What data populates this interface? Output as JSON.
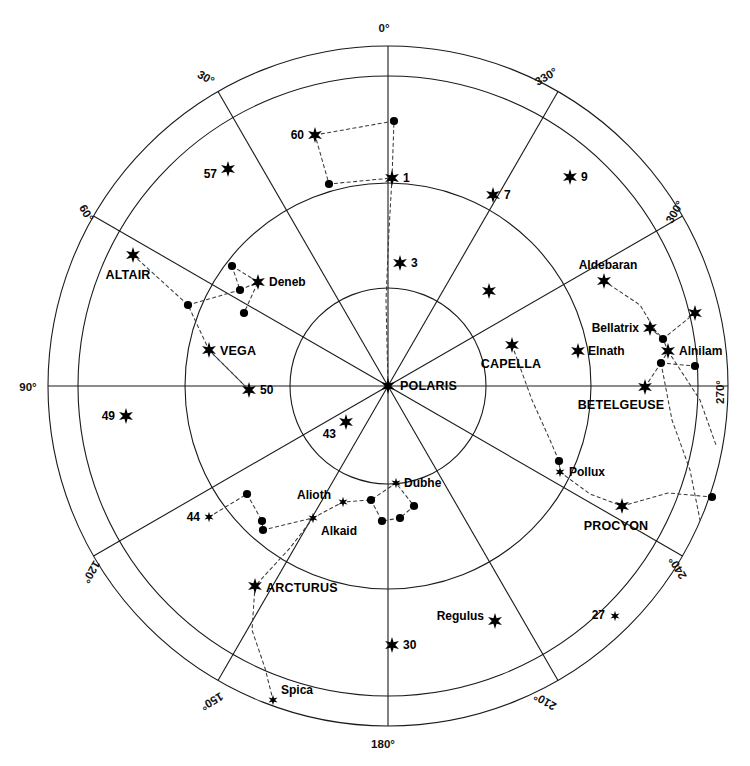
{
  "chart_data": {
    "type": "scatter",
    "title": "",
    "projection": "polar-azimuthal",
    "center": {
      "x": 388,
      "y": 386,
      "label": "POLARIS"
    },
    "radial_axis": {
      "description": "Altitude rings (concentric circles)",
      "ring_radii_px": [
        98,
        203,
        310,
        340
      ],
      "grid": true
    },
    "angular_axis": {
      "label_suffix": "°",
      "tick_step": 30,
      "direction": "clockwise-from-top-is-decreasing",
      "ticks": [
        {
          "value": 0,
          "text": "0°"
        },
        {
          "value": 330,
          "text": "330°"
        },
        {
          "value": 300,
          "text": "300°"
        },
        {
          "value": 270,
          "text": "270°"
        },
        {
          "value": 240,
          "text": "240°"
        },
        {
          "value": 210,
          "text": "210°"
        },
        {
          "value": 180,
          "text": "180°"
        },
        {
          "value": 150,
          "text": "150°"
        },
        {
          "value": 120,
          "text": "120°"
        },
        {
          "value": 90,
          "text": "90°"
        },
        {
          "value": 60,
          "text": "60°"
        },
        {
          "value": 30,
          "text": "30°"
        }
      ]
    },
    "legend": {
      "position": "none",
      "entries": []
    },
    "stars": [
      {
        "name": "POLARIS",
        "label": "POLARIS",
        "x": 388,
        "y": 386,
        "mag": "bright",
        "marker": "star",
        "label_dx": 12,
        "label_dy": 4,
        "anchor": "start",
        "style": "caps"
      },
      {
        "name": "star-60",
        "label": "60",
        "x": 315,
        "y": 135,
        "mag": "bright",
        "marker": "star",
        "label_dx": -11,
        "label_dy": 4,
        "anchor": "end",
        "style": "small"
      },
      {
        "name": "star-1",
        "label": "1",
        "x": 392,
        "y": 178,
        "mag": "bright",
        "marker": "star",
        "label_dx": 11,
        "label_dy": 4,
        "anchor": "start",
        "style": "small"
      },
      {
        "name": "star-57",
        "label": "57",
        "x": 228,
        "y": 169,
        "mag": "bright",
        "marker": "star",
        "label_dx": -11,
        "label_dy": 9,
        "anchor": "end",
        "style": "small"
      },
      {
        "name": "star-7",
        "label": "7",
        "x": 493,
        "y": 195,
        "mag": "bright",
        "marker": "star",
        "label_dx": 11,
        "label_dy": 4,
        "anchor": "start",
        "style": "small"
      },
      {
        "name": "star-9",
        "label": "9",
        "x": 570,
        "y": 177,
        "mag": "bright",
        "marker": "star",
        "label_dx": 11,
        "label_dy": 4,
        "anchor": "start",
        "style": "small"
      },
      {
        "name": "star-3",
        "label": "3",
        "x": 400,
        "y": 263,
        "mag": "bright",
        "marker": "star",
        "label_dx": 11,
        "label_dy": 4,
        "anchor": "start",
        "style": "small"
      },
      {
        "name": "ALTAIR",
        "label": "ALTAIR",
        "x": 133,
        "y": 255,
        "mag": "bright",
        "marker": "star",
        "label_dx": -5,
        "label_dy": 24,
        "anchor": "middle",
        "style": "caps"
      },
      {
        "name": "Deneb",
        "label": "Deneb",
        "x": 258,
        "y": 282,
        "mag": "bright",
        "marker": "star",
        "label_dx": 11,
        "label_dy": 4,
        "anchor": "start",
        "style": "small"
      },
      {
        "name": "VEGA",
        "label": "VEGA",
        "x": 209,
        "y": 350,
        "mag": "bright",
        "marker": "star",
        "label_dx": 11,
        "label_dy": 5,
        "anchor": "start",
        "style": "caps"
      },
      {
        "name": "star-50",
        "label": "50",
        "x": 249,
        "y": 390,
        "mag": "bright",
        "marker": "star",
        "label_dx": 11,
        "label_dy": 4,
        "anchor": "start",
        "style": "small"
      },
      {
        "name": "star-49",
        "label": "49",
        "x": 126,
        "y": 416,
        "mag": "bright",
        "marker": "star",
        "label_dx": -11,
        "label_dy": 4,
        "anchor": "end",
        "style": "small"
      },
      {
        "name": "star-43",
        "label": "43",
        "x": 346,
        "y": 422,
        "mag": "bright",
        "marker": "star",
        "label_dx": -10,
        "label_dy": 16,
        "anchor": "end",
        "style": "small"
      },
      {
        "name": "star-44",
        "label": "44",
        "x": 209,
        "y": 517,
        "mag": "faint",
        "marker": "star",
        "label_dx": -9,
        "label_dy": 4,
        "anchor": "end",
        "style": "small"
      },
      {
        "name": "Alkaid",
        "label": "Alkaid",
        "x": 313,
        "y": 518,
        "mag": "faint",
        "marker": "star",
        "label_dx": 8,
        "label_dy": 17,
        "anchor": "start",
        "style": "small"
      },
      {
        "name": "Alioth",
        "label": "Alioth",
        "x": 343,
        "y": 502,
        "mag": "faint",
        "marker": "star",
        "label_dx": -12,
        "label_dy": -3,
        "anchor": "end",
        "style": "small"
      },
      {
        "name": "Dubhe",
        "label": "Dubhe",
        "x": 396,
        "y": 483,
        "mag": "faint",
        "marker": "star",
        "label_dx": 8,
        "label_dy": 4,
        "anchor": "start",
        "style": "small"
      },
      {
        "name": "ARCTURUS",
        "label": "ARCTURUS",
        "x": 255,
        "y": 586,
        "mag": "bright",
        "marker": "star",
        "label_dx": 11,
        "label_dy": 6,
        "anchor": "start",
        "style": "caps"
      },
      {
        "name": "Spica",
        "label": "Spica",
        "x": 273,
        "y": 700,
        "mag": "faint",
        "marker": "star",
        "label_dx": 8,
        "label_dy": -6,
        "anchor": "start",
        "style": "small"
      },
      {
        "name": "star-30",
        "label": "30",
        "x": 392,
        "y": 645,
        "mag": "bright",
        "marker": "star",
        "label_dx": 11,
        "label_dy": 4,
        "anchor": "start",
        "style": "small"
      },
      {
        "name": "Regulus",
        "label": "Regulus",
        "x": 495,
        "y": 621,
        "mag": "bright",
        "marker": "star",
        "label_dx": -11,
        "label_dy": -1,
        "anchor": "end",
        "style": "small"
      },
      {
        "name": "star-27",
        "label": "27",
        "x": 615,
        "y": 616,
        "mag": "faint",
        "marker": "star",
        "label_dx": -10,
        "label_dy": 3,
        "anchor": "end",
        "style": "small"
      },
      {
        "name": "PROCYON",
        "label": "PROCYON",
        "x": 622,
        "y": 506,
        "mag": "bright",
        "marker": "star",
        "label_dx": -6,
        "label_dy": 24,
        "anchor": "middle",
        "style": "caps"
      },
      {
        "name": "Pollux",
        "label": "Pollux",
        "x": 560,
        "y": 472,
        "mag": "faint",
        "marker": "star",
        "label_dx": 9,
        "label_dy": 4,
        "anchor": "start",
        "style": "small"
      },
      {
        "name": "CAPELLA",
        "label": "CAPELLA",
        "x": 512,
        "y": 345,
        "mag": "bright",
        "marker": "star",
        "label_dx": -1,
        "label_dy": 23,
        "anchor": "middle",
        "style": "caps"
      },
      {
        "name": "BETELGEUSE",
        "label": "BETELGEUSE",
        "x": 645,
        "y": 387,
        "mag": "bright",
        "marker": "star",
        "label_dx": -24,
        "label_dy": 22,
        "anchor": "middle",
        "style": "caps"
      },
      {
        "name": "Elnath",
        "label": "Elnath",
        "x": 578,
        "y": 351,
        "mag": "bright",
        "marker": "star",
        "label_dx": 10,
        "label_dy": 4,
        "anchor": "start",
        "style": "small"
      },
      {
        "name": "Bellatrix",
        "label": "Bellatrix",
        "x": 650,
        "y": 328,
        "mag": "bright",
        "marker": "star",
        "label_dx": -11,
        "label_dy": 4,
        "anchor": "end",
        "style": "small"
      },
      {
        "name": "Aldebaran",
        "label": "Aldebaran",
        "x": 604,
        "y": 281,
        "mag": "bright",
        "marker": "star",
        "label_dx": 4,
        "label_dy": -12,
        "anchor": "middle",
        "style": "small"
      },
      {
        "name": "Alnilam",
        "label": "Alnilam",
        "x": 668,
        "y": 351,
        "mag": "bright",
        "marker": "star",
        "label_dx": 11,
        "label_dy": 4,
        "anchor": "start",
        "style": "small"
      },
      {
        "name": "orion-rigel",
        "label": "",
        "x": 695,
        "y": 313,
        "mag": "bright",
        "marker": "star",
        "label_dx": 0,
        "label_dy": 0,
        "anchor": "start",
        "style": "small"
      },
      {
        "name": "star-unlabeled-upper",
        "label": "",
        "x": 489,
        "y": 291,
        "mag": "bright",
        "marker": "star",
        "label_dx": 0,
        "label_dy": 0,
        "anchor": "start",
        "style": "small"
      }
    ],
    "dots": [
      {
        "name": "dot-ursa-minor-top",
        "x": 394,
        "y": 121
      },
      {
        "name": "dot-ursa-minor-left",
        "x": 329,
        "y": 184
      },
      {
        "name": "dot-cygnus-a",
        "x": 232,
        "y": 266
      },
      {
        "name": "dot-cygnus-b",
        "x": 240,
        "y": 290
      },
      {
        "name": "dot-cygnus-c",
        "x": 244,
        "y": 313
      },
      {
        "name": "dot-lyra-w",
        "x": 188,
        "y": 305
      },
      {
        "name": "dot-big-dipper-a",
        "x": 247,
        "y": 494
      },
      {
        "name": "dot-big-dipper-b",
        "x": 262,
        "y": 521
      },
      {
        "name": "dot-big-dipper-c",
        "x": 263,
        "y": 530
      },
      {
        "name": "dot-big-dipper-d",
        "x": 371,
        "y": 500
      },
      {
        "name": "dot-big-dipper-e",
        "x": 382,
        "y": 521
      },
      {
        "name": "dot-big-dipper-f",
        "x": 400,
        "y": 518
      },
      {
        "name": "dot-big-dipper-g",
        "x": 414,
        "y": 506
      },
      {
        "name": "dot-gemini-castor",
        "x": 559,
        "y": 461
      },
      {
        "name": "dot-orion-belt-top",
        "x": 663,
        "y": 339
      },
      {
        "name": "dot-orion-belt-mid",
        "x": 661,
        "y": 363
      },
      {
        "name": "dot-orion-right",
        "x": 695,
        "y": 366
      },
      {
        "name": "dot-canis-minor-e",
        "x": 712,
        "y": 497
      }
    ],
    "constellation_lines": [
      {
        "name": "ursa-minor-box",
        "points": [
          [
            315,
            135
          ],
          [
            394,
            121
          ],
          [
            392,
            178
          ],
          [
            329,
            184
          ],
          [
            315,
            135
          ]
        ]
      },
      {
        "name": "polaris-to-ursa-minor",
        "points": [
          [
            388,
            386
          ],
          [
            386,
            300
          ],
          [
            389,
            230
          ],
          [
            392,
            178
          ]
        ]
      },
      {
        "name": "cygnus",
        "points": [
          [
            232,
            266
          ],
          [
            258,
            282
          ],
          [
            244,
            313
          ]
        ]
      },
      {
        "name": "cygnus-cross",
        "points": [
          [
            232,
            266
          ],
          [
            240,
            290
          ],
          [
            258,
            282
          ]
        ]
      },
      {
        "name": "cygnus-wing",
        "points": [
          [
            188,
            305
          ],
          [
            240,
            290
          ]
        ]
      },
      {
        "name": "altair-vega",
        "points": [
          [
            133,
            255
          ],
          [
            188,
            305
          ],
          [
            209,
            350
          ],
          [
            249,
            390
          ]
        ]
      },
      {
        "name": "vega-chain",
        "points": [
          [
            209,
            350
          ],
          [
            249,
            390
          ]
        ]
      },
      {
        "name": "big-dipper-left",
        "points": [
          [
            209,
            517
          ],
          [
            247,
            494
          ],
          [
            262,
            521
          ],
          [
            263,
            530
          ]
        ]
      },
      {
        "name": "big-dipper-handle",
        "points": [
          [
            263,
            530
          ],
          [
            313,
            518
          ],
          [
            343,
            502
          ],
          [
            371,
            500
          ],
          [
            396,
            483
          ]
        ]
      },
      {
        "name": "big-dipper-bowl",
        "points": [
          [
            371,
            500
          ],
          [
            382,
            521
          ],
          [
            400,
            518
          ],
          [
            414,
            506
          ],
          [
            396,
            483
          ]
        ]
      },
      {
        "name": "arcturus-spica",
        "points": [
          [
            313,
            518
          ],
          [
            290,
            548
          ],
          [
            255,
            586
          ],
          [
            252,
            630
          ],
          [
            265,
            668
          ],
          [
            273,
            700
          ]
        ]
      },
      {
        "name": "capella-pollux",
        "points": [
          [
            512,
            345
          ],
          [
            532,
            400
          ],
          [
            550,
            440
          ],
          [
            559,
            461
          ],
          [
            560,
            472
          ]
        ]
      },
      {
        "name": "gemini-procyon",
        "points": [
          [
            560,
            472
          ],
          [
            590,
            494
          ],
          [
            622,
            506
          ]
        ]
      },
      {
        "name": "procyon-east",
        "points": [
          [
            622,
            506
          ],
          [
            668,
            493
          ],
          [
            712,
            497
          ]
        ]
      },
      {
        "name": "aldebaran-orion",
        "points": [
          [
            604,
            281
          ],
          [
            640,
            305
          ],
          [
            655,
            330
          ],
          [
            663,
            339
          ]
        ]
      },
      {
        "name": "bellatrix-belt",
        "points": [
          [
            650,
            328
          ],
          [
            663,
            339
          ]
        ]
      },
      {
        "name": "belt-rigel",
        "points": [
          [
            663,
            339
          ],
          [
            695,
            313
          ]
        ]
      },
      {
        "name": "belt-line",
        "points": [
          [
            661,
            363
          ],
          [
            668,
            351
          ],
          [
            663,
            339
          ]
        ]
      },
      {
        "name": "belt-east",
        "points": [
          [
            661,
            363
          ],
          [
            695,
            366
          ]
        ]
      },
      {
        "name": "belt-betelgeuse",
        "points": [
          [
            661,
            363
          ],
          [
            645,
            387
          ]
        ]
      },
      {
        "name": "orion-south",
        "points": [
          [
            661,
            363
          ],
          [
            672,
            420
          ],
          [
            690,
            470
          ],
          [
            700,
            520
          ]
        ]
      },
      {
        "name": "orion-south-east",
        "points": [
          [
            668,
            351
          ],
          [
            700,
            400
          ],
          [
            716,
            445
          ]
        ]
      }
    ]
  },
  "axis_labels": [
    {
      "name": "tick-0",
      "text": "0°",
      "x": 384,
      "y": 32,
      "rotate": 0,
      "anchor": "middle"
    },
    {
      "name": "tick-330",
      "text": "330°",
      "x": 548,
      "y": 80,
      "rotate": -30,
      "anchor": "middle"
    },
    {
      "name": "tick-300",
      "text": "300°",
      "x": 678,
      "y": 214,
      "rotate": -60,
      "anchor": "middle"
    },
    {
      "name": "tick-270",
      "text": "270°",
      "x": 724,
      "y": 392,
      "rotate": -90,
      "anchor": "middle"
    },
    {
      "name": "tick-240",
      "text": "240°",
      "x": 681,
      "y": 566,
      "rotate": -120,
      "anchor": "middle"
    },
    {
      "name": "tick-210",
      "text": "210°",
      "x": 547,
      "y": 698,
      "rotate": -150,
      "anchor": "middle"
    },
    {
      "name": "tick-180",
      "text": "180°",
      "x": 383,
      "y": 748,
      "rotate": 0,
      "anchor": "middle"
    },
    {
      "name": "tick-150",
      "text": "150°",
      "x": 210,
      "y": 698,
      "rotate": 150,
      "anchor": "middle"
    },
    {
      "name": "tick-120",
      "text": "120°",
      "x": 88,
      "y": 570,
      "rotate": 120,
      "anchor": "middle"
    },
    {
      "name": "tick-90",
      "text": "90°",
      "x": 28,
      "y": 391,
      "rotate": 0,
      "anchor": "middle"
    },
    {
      "name": "tick-60",
      "text": "60°",
      "x": 83,
      "y": 215,
      "rotate": 60,
      "anchor": "middle"
    },
    {
      "name": "tick-30",
      "text": "30°",
      "x": 204,
      "y": 81,
      "rotate": 30,
      "anchor": "middle"
    }
  ],
  "colors": {
    "background": "#ffffff",
    "grid": "#1a1a1a",
    "constellation_line": "#3a3a3a",
    "marker": "#000000",
    "text": "#000000"
  }
}
